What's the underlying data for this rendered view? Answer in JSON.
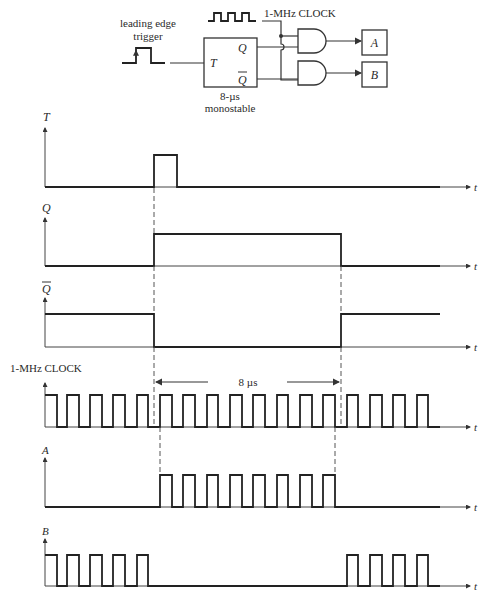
{
  "circuit": {
    "trigger_label_line1": "leading edge",
    "trigger_label_line2": "trigger",
    "clock_label": "1-MHz CLOCK",
    "monostable_input": "T",
    "monostable_output_q": "Q",
    "monostable_output_qbar": "Q",
    "monostable_caption_line1": "8-µs",
    "monostable_caption_line2": "monostable",
    "output_a": "A",
    "output_b": "B"
  },
  "timing": {
    "axis_label": "t",
    "signals": [
      {
        "name": "T",
        "label": "T"
      },
      {
        "name": "Q",
        "label": "Q"
      },
      {
        "name": "Qbar",
        "label": "Q"
      },
      {
        "name": "clock",
        "label": "1-MHz CLOCK"
      },
      {
        "name": "A",
        "label": "A"
      },
      {
        "name": "B",
        "label": "B"
      }
    ],
    "duration_label": "8 µs"
  },
  "colors": {
    "line": "#222222",
    "background": "#ffffff"
  }
}
